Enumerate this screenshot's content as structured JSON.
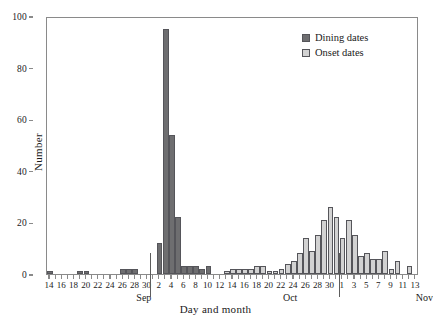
{
  "chart_data": {
    "type": "bar",
    "title": "",
    "xlabel": "Day and month",
    "ylabel": "Number",
    "ylim": [
      0,
      100
    ],
    "yticks": [
      0,
      20,
      40,
      60,
      80,
      100
    ],
    "grid": false,
    "legend_position": "top-right",
    "x_tick_labels": [
      "14",
      "16",
      "18",
      "20",
      "22",
      "24",
      "26",
      "28",
      "30",
      "2",
      "4",
      "6",
      "8",
      "10",
      "12",
      "14",
      "16",
      "18",
      "20",
      "22",
      "24",
      "26",
      "28",
      "30",
      "1",
      "3",
      "5",
      "7",
      "9",
      "11",
      "13"
    ],
    "month_labels": [
      "Sep",
      "Oct",
      "Nov"
    ],
    "colors": {
      "dining": "#6e6e70",
      "onset": "#d2d2d2",
      "axis": "#8a8a8a",
      "bar_edge": "#55555a",
      "background": "#ffffff",
      "text": "#1a1a1a"
    },
    "series": [
      {
        "name": "Dining dates",
        "key": "dining",
        "values": [
          {
            "date": "Sep 14",
            "value": 1
          },
          {
            "date": "Sep 15",
            "value": 0
          },
          {
            "date": "Sep 16",
            "value": 0
          },
          {
            "date": "Sep 17",
            "value": 0
          },
          {
            "date": "Sep 18",
            "value": 0
          },
          {
            "date": "Sep 19",
            "value": 1
          },
          {
            "date": "Sep 20",
            "value": 1
          },
          {
            "date": "Sep 21",
            "value": 0
          },
          {
            "date": "Sep 22",
            "value": 0
          },
          {
            "date": "Sep 23",
            "value": 0
          },
          {
            "date": "Sep 24",
            "value": 0
          },
          {
            "date": "Sep 25",
            "value": 0
          },
          {
            "date": "Sep 26",
            "value": 2
          },
          {
            "date": "Sep 27",
            "value": 2
          },
          {
            "date": "Sep 28",
            "value": 2
          },
          {
            "date": "Sep 29",
            "value": 0
          },
          {
            "date": "Sep 30",
            "value": 0
          },
          {
            "date": "Oct 1",
            "value": 0
          },
          {
            "date": "Oct 2",
            "value": 12
          },
          {
            "date": "Oct 3",
            "value": 95
          },
          {
            "date": "Oct 4",
            "value": 54
          },
          {
            "date": "Oct 5",
            "value": 22
          },
          {
            "date": "Oct 6",
            "value": 3
          },
          {
            "date": "Oct 7",
            "value": 3
          },
          {
            "date": "Oct 8",
            "value": 3
          },
          {
            "date": "Oct 9",
            "value": 2
          },
          {
            "date": "Oct 10",
            "value": 3
          },
          {
            "date": "Oct 11",
            "value": 0
          },
          {
            "date": "Oct 12",
            "value": 0
          }
        ]
      },
      {
        "name": "Onset dates",
        "key": "onset",
        "values": [
          {
            "date": "Oct 13",
            "value": 1
          },
          {
            "date": "Oct 14",
            "value": 2
          },
          {
            "date": "Oct 15",
            "value": 2
          },
          {
            "date": "Oct 16",
            "value": 2
          },
          {
            "date": "Oct 17",
            "value": 2
          },
          {
            "date": "Oct 18",
            "value": 3
          },
          {
            "date": "Oct 19",
            "value": 3
          },
          {
            "date": "Oct 20",
            "value": 1
          },
          {
            "date": "Oct 21",
            "value": 1
          },
          {
            "date": "Oct 22",
            "value": 2
          },
          {
            "date": "Oct 23",
            "value": 4
          },
          {
            "date": "Oct 24",
            "value": 5
          },
          {
            "date": "Oct 25",
            "value": 8
          },
          {
            "date": "Oct 26",
            "value": 14
          },
          {
            "date": "Oct 27",
            "value": 9
          },
          {
            "date": "Oct 28",
            "value": 15
          },
          {
            "date": "Oct 29",
            "value": 21
          },
          {
            "date": "Oct 30",
            "value": 26
          },
          {
            "date": "Oct 31",
            "value": 22
          },
          {
            "date": "Nov 1",
            "value": 14
          },
          {
            "date": "Nov 2",
            "value": 21
          },
          {
            "date": "Nov 3",
            "value": 15
          },
          {
            "date": "Nov 4",
            "value": 7
          },
          {
            "date": "Nov 5",
            "value": 8
          },
          {
            "date": "Nov 6",
            "value": 6
          },
          {
            "date": "Nov 7",
            "value": 6
          },
          {
            "date": "Nov 8",
            "value": 9
          },
          {
            "date": "Nov 9",
            "value": 2
          },
          {
            "date": "Nov 10",
            "value": 5
          },
          {
            "date": "Nov 11",
            "value": 0
          },
          {
            "date": "Nov 12",
            "value": 3
          },
          {
            "date": "Nov 13",
            "value": 0
          }
        ]
      }
    ]
  },
  "legend": {
    "items": [
      {
        "label": "Dining dates",
        "key": "dining"
      },
      {
        "label": "Onset dates",
        "key": "onset"
      }
    ]
  }
}
